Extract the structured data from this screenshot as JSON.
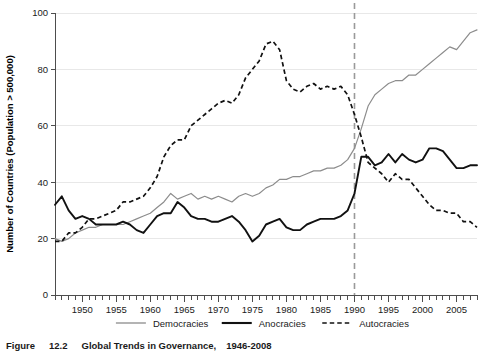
{
  "figure": {
    "caption_label": "Figure",
    "caption_number": "12.2",
    "caption_title": "Global Trends in Governance,",
    "caption_years": "1946-2008"
  },
  "axes": {
    "ylabel": "Number of Countries (Population > 500,000)",
    "xlabel": "",
    "ytick_labels": [
      "0",
      "20",
      "40",
      "60",
      "80",
      "100"
    ],
    "xtick_labels": [
      "1950",
      "1955",
      "1960",
      "1965",
      "1970",
      "1975",
      "1980",
      "1985",
      "1990",
      "1995",
      "2000",
      "2005"
    ]
  },
  "legend": {
    "position": "bottom",
    "entries": [
      {
        "label": "Democracies",
        "style": "solid",
        "color": "#8c8c8c"
      },
      {
        "label": "Anocracies",
        "style": "solid",
        "color": "#111111"
      },
      {
        "label": "Autocracies",
        "style": "dashed",
        "color": "#111111"
      }
    ]
  },
  "annotations": [
    {
      "name": "year-1990-marker",
      "type": "vline",
      "x": 1990,
      "style": "dashed",
      "color": "#9a9a9a"
    }
  ],
  "chart_data": {
    "type": "line",
    "title": "",
    "xlabel": "",
    "ylabel": "Number of Countries (Population > 500,000)",
    "xlim": [
      1946,
      2008
    ],
    "ylim": [
      0,
      100
    ],
    "grid": true,
    "legend_position": "bottom",
    "x": [
      1946,
      1947,
      1948,
      1949,
      1950,
      1951,
      1952,
      1953,
      1954,
      1955,
      1956,
      1957,
      1958,
      1959,
      1960,
      1961,
      1962,
      1963,
      1964,
      1965,
      1966,
      1967,
      1968,
      1969,
      1970,
      1971,
      1972,
      1973,
      1974,
      1975,
      1976,
      1977,
      1978,
      1979,
      1980,
      1981,
      1982,
      1983,
      1984,
      1985,
      1986,
      1987,
      1988,
      1989,
      1990,
      1991,
      1992,
      1993,
      1994,
      1995,
      1996,
      1997,
      1998,
      1999,
      2000,
      2001,
      2002,
      2003,
      2004,
      2005,
      2006,
      2007,
      2008
    ],
    "series": [
      {
        "name": "Democracies",
        "style": "solid",
        "color": "#8c8c8c",
        "values": [
          20,
          19,
          20,
          22,
          23,
          24,
          24,
          25,
          25,
          25,
          25,
          26,
          27,
          28,
          29,
          31,
          33,
          36,
          34,
          35,
          36,
          34,
          35,
          34,
          35,
          34,
          33,
          35,
          36,
          35,
          36,
          38,
          39,
          41,
          41,
          42,
          42,
          43,
          44,
          44,
          45,
          45,
          46,
          48,
          52,
          59,
          67,
          71,
          73,
          75,
          76,
          76,
          78,
          78,
          80,
          82,
          84,
          86,
          88,
          87,
          90,
          93,
          94
        ]
      },
      {
        "name": "Anocracies",
        "style": "solid",
        "color": "#111111",
        "values": [
          32,
          35,
          30,
          27,
          28,
          27,
          25,
          25,
          25,
          25,
          26,
          25,
          23,
          22,
          25,
          28,
          29,
          29,
          33,
          31,
          28,
          27,
          27,
          26,
          26,
          27,
          28,
          26,
          23,
          19,
          21,
          25,
          26,
          27,
          24,
          23,
          23,
          25,
          26,
          27,
          27,
          27,
          28,
          30,
          36,
          49,
          49,
          46,
          47,
          50,
          47,
          50,
          48,
          47,
          48,
          52,
          52,
          51,
          48,
          45,
          45,
          46,
          46
        ]
      },
      {
        "name": "Autocracies",
        "style": "dashed",
        "color": "#111111",
        "values": [
          19,
          19,
          22,
          22,
          24,
          27,
          27,
          28,
          29,
          30,
          33,
          33,
          34,
          35,
          38,
          42,
          49,
          53,
          55,
          55,
          60,
          62,
          64,
          66,
          68,
          69,
          68,
          71,
          77,
          80,
          83,
          89,
          90,
          87,
          76,
          73,
          72,
          74,
          75,
          73,
          74,
          73,
          74,
          71,
          64,
          56,
          47,
          45,
          43,
          40,
          43,
          41,
          41,
          38,
          35,
          32,
          30,
          30,
          29,
          29,
          26,
          26,
          24
        ]
      }
    ]
  }
}
